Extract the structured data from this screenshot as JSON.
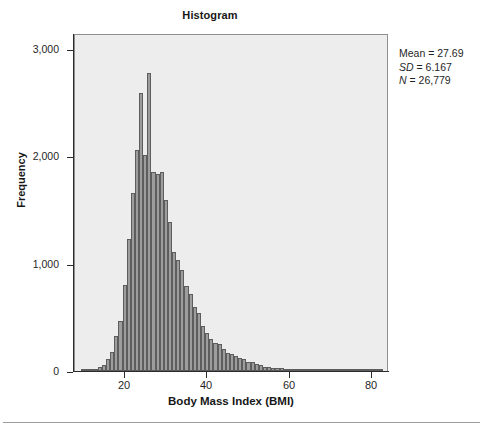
{
  "figure": {
    "title": "Histogram",
    "background": "#ffffff",
    "plot_background": "#ededed",
    "bar_fill": "#9d9d9d",
    "bar_edge": "#5d5d5d",
    "axis_color": "#2b2b2b"
  },
  "annotations": {
    "mean_label": "Mean",
    "mean_value": "27.69",
    "sd_label": "SD",
    "sd_value": "6.167",
    "n_label": "N",
    "n_value": "26,779",
    "mean_line": "Mean = 27.69",
    "sd_line": "SD = 6.167",
    "n_line": "N = 26,779"
  },
  "chart_data": {
    "type": "bar",
    "title": "Histogram",
    "xlabel": "Body Mass Index (BMI)",
    "ylabel": "Frequency",
    "xlim": [
      8,
      84
    ],
    "ylim": [
      0,
      3150
    ],
    "grid": false,
    "legend": "none",
    "xticks": [
      "20",
      "40",
      "60",
      "80"
    ],
    "xtick_values": [
      20,
      40,
      60,
      80
    ],
    "yticks": [
      "0",
      "1,000",
      "2,000",
      "3,000"
    ],
    "ytick_values": [
      0,
      1000,
      2000,
      3000
    ],
    "bin_width": 1,
    "bin_centers": [
      10,
      11,
      12,
      13,
      14,
      15,
      16,
      17,
      18,
      19,
      20,
      21,
      22,
      23,
      24,
      25,
      26,
      27,
      28,
      29,
      30,
      31,
      32,
      33,
      34,
      35,
      36,
      37,
      38,
      39,
      40,
      41,
      42,
      43,
      44,
      45,
      46,
      47,
      48,
      49,
      50,
      51,
      52,
      53,
      54,
      55,
      56,
      57,
      58,
      59,
      60,
      61,
      62,
      63,
      64,
      65,
      66,
      67,
      68,
      69,
      70,
      71,
      72,
      73,
      74,
      75,
      76,
      77,
      78,
      79,
      80,
      81,
      82
    ],
    "values": [
      5,
      8,
      12,
      20,
      35,
      60,
      110,
      175,
      330,
      470,
      800,
      1230,
      1660,
      2060,
      2590,
      2010,
      2780,
      1855,
      1840,
      1855,
      1590,
      1390,
      1110,
      1030,
      940,
      790,
      715,
      600,
      540,
      420,
      355,
      300,
      265,
      255,
      205,
      170,
      160,
      140,
      125,
      110,
      85,
      80,
      70,
      55,
      40,
      35,
      32,
      28,
      25,
      22,
      18,
      16,
      14,
      12,
      11,
      10,
      9,
      8,
      8,
      7,
      6,
      6,
      5,
      5,
      4,
      4,
      4,
      3,
      3,
      3,
      3,
      2,
      2
    ]
  }
}
